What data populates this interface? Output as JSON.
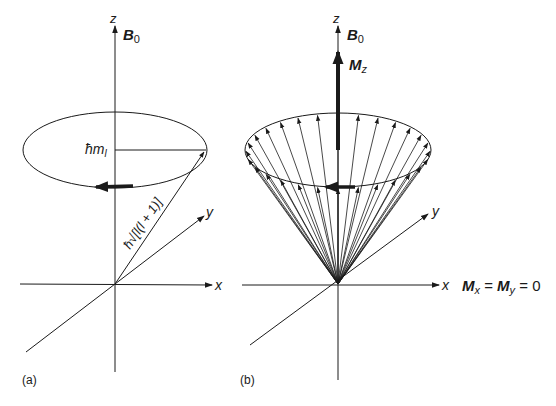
{
  "panels": [
    {
      "id": "a",
      "caption": "(a)",
      "axes": {
        "z": "z",
        "x": "x",
        "y": "y"
      },
      "field_label": {
        "main": "B",
        "sub": "0"
      },
      "projection_label": {
        "prefix": "ħm",
        "sub": "l"
      },
      "vector_label": "ħ√[l(l + 1)]"
    },
    {
      "id": "b",
      "caption": "(b)",
      "axes": {
        "z": "z",
        "x": "x",
        "y": "y"
      },
      "field_label": {
        "main": "B",
        "sub": "0"
      },
      "net_magnetization_label": {
        "main": "M",
        "sub": "z"
      },
      "transverse_label": {
        "mx": "M",
        "mx_sub": "x",
        "eq1": " = ",
        "my": "M",
        "my_sub": "y",
        "eq2": " = 0"
      }
    }
  ],
  "colors": {
    "ink": "#1a1a1a",
    "background": "#ffffff"
  }
}
